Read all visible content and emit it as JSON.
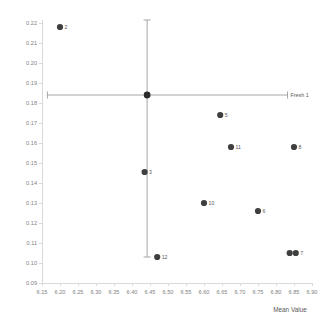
{
  "chart_data": {
    "type": "scatter",
    "title": "",
    "xlabel": "Mean Value",
    "ylabel": "",
    "xlim": [
      6.15,
      6.9
    ],
    "ylim": [
      0.09,
      0.22
    ],
    "xticks": [
      "6.15",
      "6.20",
      "6.25",
      "6.30",
      "6.35",
      "6.40",
      "6.45",
      "6.50",
      "6.55",
      "6.60",
      "6.65",
      "6.70",
      "6.75",
      "6.80",
      "6.85",
      "6.90"
    ],
    "yticks": [
      "0.09",
      "0.10",
      "0.11",
      "0.12",
      "0.13",
      "0.14",
      "0.15",
      "0.16",
      "0.17",
      "0.18",
      "0.19",
      "0.20",
      "0.21",
      "0.22"
    ],
    "grid": false,
    "legend": "none",
    "marker_color": "#3f3f3f",
    "errorbar_color": "#a6a6a6",
    "points": [
      {
        "label": "2",
        "x": 6.2,
        "y": 0.218
      },
      {
        "label": "5",
        "x": 6.645,
        "y": 0.174
      },
      {
        "label": "11",
        "x": 6.675,
        "y": 0.158
      },
      {
        "label": "8",
        "x": 6.85,
        "y": 0.158
      },
      {
        "label": "3",
        "x": 6.435,
        "y": 0.1455
      },
      {
        "label": "10",
        "x": 6.6,
        "y": 0.13
      },
      {
        "label": "6",
        "x": 6.75,
        "y": 0.126
      },
      {
        "label": "12",
        "x": 6.47,
        "y": 0.103
      },
      {
        "label": "9",
        "x": 6.838,
        "y": 0.105
      },
      {
        "label": "7",
        "x": 6.855,
        "y": 0.105
      }
    ],
    "errorbar": {
      "series_label": "Fresh 1",
      "x": 6.442,
      "y": 0.184,
      "x_low": 6.165,
      "x_high": 6.832,
      "y_low": 0.103,
      "y_high": 0.2215
    }
  },
  "axes": {
    "x_title": "Mean Value"
  }
}
